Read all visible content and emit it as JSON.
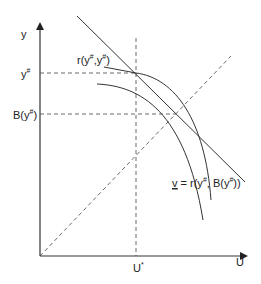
{
  "axes": {
    "y_label": "y",
    "x_label": "U"
  },
  "labels": {
    "y_sharp": "y",
    "y_sharp_sup": "#",
    "b_y_sharp_pre": "B(y",
    "b_y_sharp_sup": "#",
    "b_y_sharp_post": ")",
    "r_label_pre": "r(y",
    "r_label_sup1": "#",
    "r_label_mid": ",y",
    "r_label_sup2": "#",
    "r_label_post": ")",
    "u_star": "U",
    "u_star_sup": "*",
    "v_label_v": "v",
    "v_label_mid": " = r(y",
    "v_label_sup1": "#",
    "v_label_mid2": ", B(y",
    "v_label_sup2": "#",
    "v_label_post": "))"
  },
  "colors": {
    "line": "#333333",
    "text": "#222222"
  }
}
